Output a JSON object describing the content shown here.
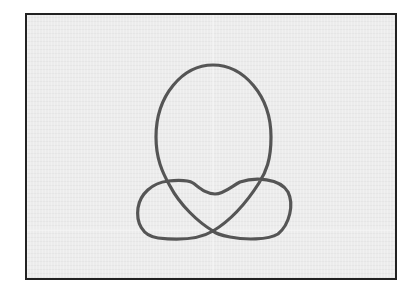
{
  "figure": {
    "title": "",
    "colors": {
      "background": "#ececec",
      "frame": "#222222",
      "curve": "#555555",
      "grid": "#f7f7f7"
    },
    "stroke_width": 3.2
  },
  "frame": {
    "x": 25,
    "y": 13,
    "width": 368,
    "height": 263
  },
  "grid": {
    "vertical_center_x": 213,
    "horizontal_y": 230
  },
  "curve": {
    "path": "M 213 65 C 243 65, 271 95, 271 137 C 271 160, 266 172, 259 183 C 245 205, 228 222, 213 231 C 198 240, 175 240, 158 238 C 142 236, 136 222, 138 208 C 140 194, 152 183, 168 181 C 178 180, 188 180, 193 183 C 200 188, 206 194, 215 194 C 224 194, 232 186, 240 182 C 255 177, 280 178, 288 192 C 294 204, 290 224, 278 234 C 268 240, 245 240, 230 237 C 220 235, 215 233, 213 231 C 198 222, 180 205, 170 186 C 162 172, 156 158, 156 137 C 156 95, 183 65, 213 65 Z",
    "key_points": {
      "top": [
        213,
        65
      ],
      "left_extreme_oval": [
        156,
        137
      ],
      "right_extreme_oval": [
        271,
        137
      ],
      "bottom_crossing": [
        213,
        231
      ],
      "left_upper_crossing": [
        167,
        181
      ],
      "right_upper_crossing": [
        260,
        181
      ],
      "center_dip": [
        215,
        194
      ],
      "left_lobe_extreme": [
        138,
        208
      ],
      "right_lobe_extreme": [
        290,
        208
      ]
    }
  }
}
